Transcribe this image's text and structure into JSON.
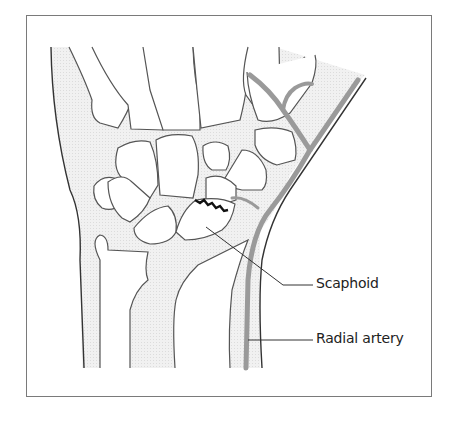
{
  "figure": {
    "labels": [
      {
        "id": "scaphoid",
        "text": "Scaphoid"
      },
      {
        "id": "radial_artery",
        "text": "Radial artery"
      }
    ],
    "colors": {
      "outline": "#555555",
      "soft_tissue_fill": "#ececec",
      "artery": "#9a9a9a",
      "fracture_line": "#111111",
      "frame_border": "#7a7a7a"
    }
  }
}
